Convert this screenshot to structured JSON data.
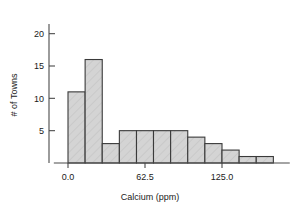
{
  "chart_data": {
    "type": "bar",
    "title": "",
    "xlabel": "Calcium (ppm)",
    "ylabel": "# of Towns",
    "xlim": [
      -11.5,
      180.0
    ],
    "ylim": [
      0,
      21.5
    ],
    "grid": false,
    "legend": null,
    "bin_width": 13.9,
    "categories": [
      "0.0-13.9",
      "13.9-27.8",
      "27.8-41.7",
      "41.7-55.6",
      "55.6-69.4",
      "69.4-83.3",
      "83.3-97.2",
      "97.2-111.1",
      "111.1-125.0",
      "125.0-138.9",
      "138.9-152.8",
      "152.8-166.7"
    ],
    "bin_edges": [
      0.0,
      13.9,
      27.8,
      41.7,
      55.6,
      69.4,
      83.3,
      97.2,
      111.1,
      125.0,
      138.9,
      152.8,
      166.7
    ],
    "values": [
      11,
      16,
      3,
      5,
      5,
      5,
      5,
      4,
      3,
      2,
      1,
      1
    ],
    "xticks": [
      0.0,
      62.5,
      125.0
    ],
    "xtick_labels": [
      "0.0",
      "62.5",
      "125.0"
    ],
    "yticks": [
      5,
      10,
      15,
      20
    ],
    "ytick_labels": [
      "5",
      "10",
      "15",
      "20"
    ],
    "bar_fill": "#d4d4d4",
    "bar_stroke": "#3a3a3a",
    "axis_color": "#4a4a4a"
  }
}
